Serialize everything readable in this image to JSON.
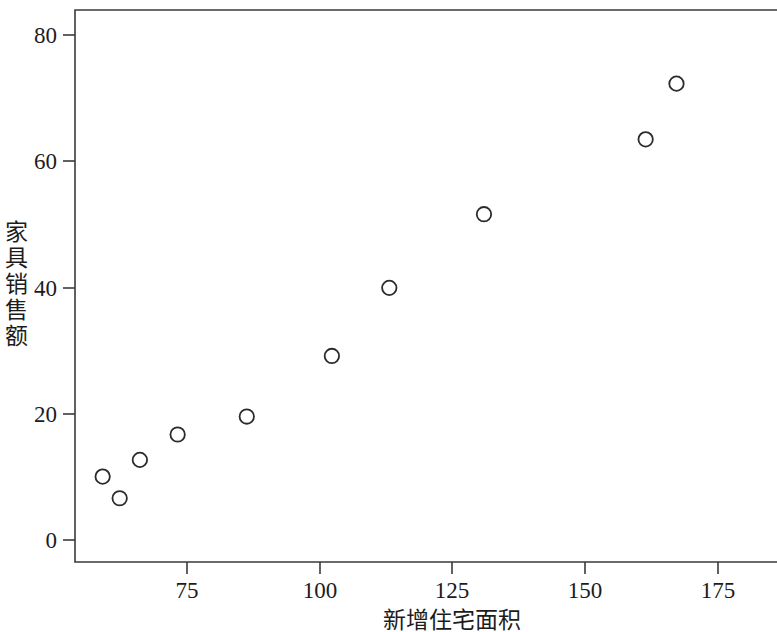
{
  "chart_data": {
    "type": "scatter",
    "title": "",
    "xlabel": "新增住宅面积",
    "ylabel": "家具销售额",
    "ylabel_chars": [
      "家",
      "具",
      "销",
      "售",
      "额"
    ],
    "xlim": [
      57.0,
      189.0
    ],
    "ylim": [
      -1.6,
      87.6
    ],
    "xticks": [
      75,
      100,
      125,
      150,
      175
    ],
    "xtick_labels": [
      "75",
      "100",
      "125",
      "150",
      "175"
    ],
    "yticks": [
      0,
      20,
      40,
      60,
      80
    ],
    "ytick_labels": [
      "0",
      "20",
      "40",
      "60",
      "80"
    ],
    "grid": false,
    "legend": null,
    "marker": "open-circle",
    "marker_color": "#2b2b2b",
    "frame_color": "#3a3a3a",
    "x": [
      62.2,
      65.4,
      69.2,
      76.3,
      89.3,
      105.3,
      116.1,
      133.9,
      164.3,
      170.1
    ],
    "y": [
      12.2,
      8.7,
      14.9,
      19.0,
      21.9,
      31.7,
      42.7,
      54.6,
      66.7,
      75.7
    ],
    "points": [
      {
        "x": 62.2,
        "y": 12.2
      },
      {
        "x": 65.4,
        "y": 8.7
      },
      {
        "x": 69.2,
        "y": 14.9
      },
      {
        "x": 76.3,
        "y": 19.0
      },
      {
        "x": 89.3,
        "y": 21.9
      },
      {
        "x": 105.3,
        "y": 31.7
      },
      {
        "x": 116.1,
        "y": 42.7
      },
      {
        "x": 133.9,
        "y": 54.6
      },
      {
        "x": 164.3,
        "y": 66.7
      },
      {
        "x": 170.1,
        "y": 75.7
      }
    ]
  },
  "figure": {
    "background": "#ffffff",
    "width": 777,
    "height": 632
  }
}
